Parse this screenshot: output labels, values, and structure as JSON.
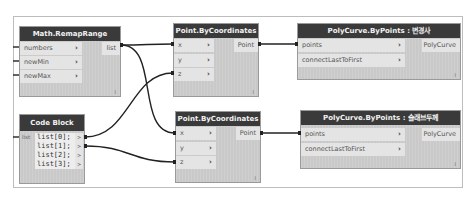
{
  "canvas": {
    "frame_color": "#bdbdbd",
    "header_color": "#3a3a3a",
    "node_body_color": "#c9c9c9",
    "port_color": "#e4e4e4",
    "wire_color": "#222222"
  },
  "nodes": {
    "remap": {
      "title": "Math.RemapRange",
      "inputs": [
        {
          "label": "numbers",
          "chevron": "›"
        },
        {
          "label": "newMin",
          "chevron": "›"
        },
        {
          "label": "newMax",
          "chevron": "›"
        }
      ],
      "output": "list",
      "footer": "l"
    },
    "codeblock": {
      "title": "Code Block",
      "input": "list",
      "lines": [
        "list[0];",
        "list[1];",
        "list[2];",
        "list[3];"
      ],
      "out_marker": ">"
    },
    "point_top": {
      "title": "Point.ByCoordinates",
      "inputs": [
        {
          "label": "x",
          "chevron": "›"
        },
        {
          "label": "y",
          "chevron": "›"
        },
        {
          "label": "z",
          "chevron": "›"
        }
      ],
      "output": "Point",
      "footer": "l"
    },
    "point_bottom": {
      "title": "Point.ByCoordinates",
      "inputs": [
        {
          "label": "x",
          "chevron": "›"
        },
        {
          "label": "y",
          "chevron": "›"
        },
        {
          "label": "z",
          "chevron": "›"
        }
      ],
      "output": "Point",
      "footer": "l"
    },
    "poly_top": {
      "title": "PolyCurve.ByPoints : 변경사",
      "inputs": [
        {
          "label": "points",
          "chevron": "›"
        },
        {
          "label": "connectLastToFirst",
          "chevron": "›"
        }
      ],
      "output": "PolyCurve",
      "footer": "l"
    },
    "poly_bottom": {
      "title": "PolyCurve.ByPoints : 슬래브두께",
      "inputs": [
        {
          "label": "points",
          "chevron": "›"
        },
        {
          "label": "connectLastToFirst",
          "chevron": "›"
        }
      ],
      "output": "PolyCurve",
      "footer": "l"
    }
  }
}
